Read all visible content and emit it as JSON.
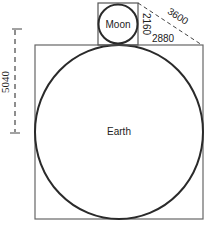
{
  "diagram": {
    "bodies": {
      "earth": {
        "label": "Earth"
      },
      "moon": {
        "label": "Moon"
      }
    },
    "dimensions": {
      "earth_side": "5040",
      "moon_side": "2160",
      "horizontal_leg": "2880",
      "hypotenuse": "3600"
    },
    "colors": {
      "stroke": "#2a2a2a",
      "box": "#555555",
      "background": "#ffffff"
    }
  }
}
